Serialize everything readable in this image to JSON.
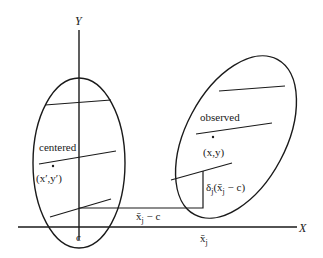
{
  "diagram": {
    "axes": {
      "y_label": "Y",
      "x_label": "X",
      "origin_tick_label": "c",
      "xbar_tick_label": "x̄",
      "xbar_tick_sub": "j"
    },
    "left_cluster": {
      "label": "centered",
      "point_label": "(x′,y′)"
    },
    "right_cluster": {
      "label": "observed",
      "point_label": "(x,y)"
    },
    "annotations": {
      "horizontal_gap": {
        "base": "x̄",
        "sub": "j",
        "rest": " − c"
      },
      "vertical_shift": {
        "delta": "δ",
        "delta_sub": "j",
        "open": "(",
        "base": "x̄",
        "sub": "j",
        "rest": " − c)"
      }
    },
    "colors": {
      "ink": "#1a1a1a",
      "background": "#ffffff"
    }
  }
}
